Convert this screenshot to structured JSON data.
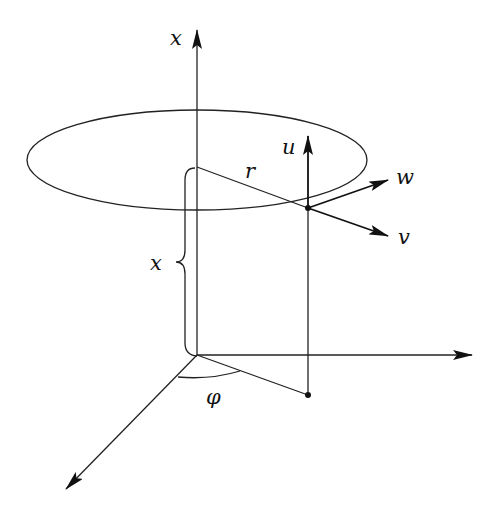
{
  "diagram": {
    "type": "3d-coordinate-figure",
    "colors": {
      "ink": "#111111",
      "background": "#ffffff"
    },
    "labels": {
      "axis_vertical": "x",
      "radius": "r",
      "component_u": "u",
      "component_w": "w",
      "component_v": "v",
      "height_brace": "x",
      "angle": "φ"
    },
    "geometry": {
      "origin": [
        197,
        355
      ],
      "vertical_axis_top": [
        197,
        28
      ],
      "horizontal_axis_end": [
        472,
        355
      ],
      "diagonal_axis_end": [
        65,
        490
      ],
      "ellipse": {
        "cx": 197,
        "cy": 160,
        "rx": 170,
        "ry": 50
      },
      "circle_center_on_axis": [
        197,
        167
      ],
      "point_on_circle": [
        308,
        208
      ],
      "projection_point": [
        308,
        395
      ],
      "u_arrow_tip": [
        308,
        136
      ],
      "w_arrow_tip": [
        388,
        180
      ],
      "v_arrow_tip": [
        388,
        236
      ]
    }
  }
}
